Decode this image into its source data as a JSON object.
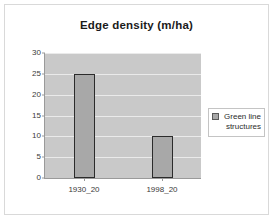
{
  "chart_data": {
    "type": "bar",
    "title": "Edge density (m/ha)",
    "xlabel": "",
    "ylabel": "",
    "categories": [
      "1930_20",
      "1998_20"
    ],
    "series": [
      {
        "name": "Green line structures",
        "values": [
          25,
          10
        ],
        "color": "#a8a8a8"
      }
    ],
    "ylim": [
      0,
      30
    ],
    "yticks": [
      0,
      5,
      10,
      15,
      20,
      25,
      30
    ],
    "ytick_labels": [
      "0",
      "5",
      "10",
      "15",
      "20",
      "25",
      "30"
    ],
    "grid": true,
    "legend": {
      "position": "right",
      "entries": [
        "Green line structures"
      ]
    },
    "plot_background": "#c9c9c9",
    "gridline_color": "#eaeaea",
    "axis_color": "#9a9a9a",
    "bar_border_color": "#2b2b2b",
    "chart_background": "#ffffff",
    "border_color": "#d9d9d9"
  }
}
